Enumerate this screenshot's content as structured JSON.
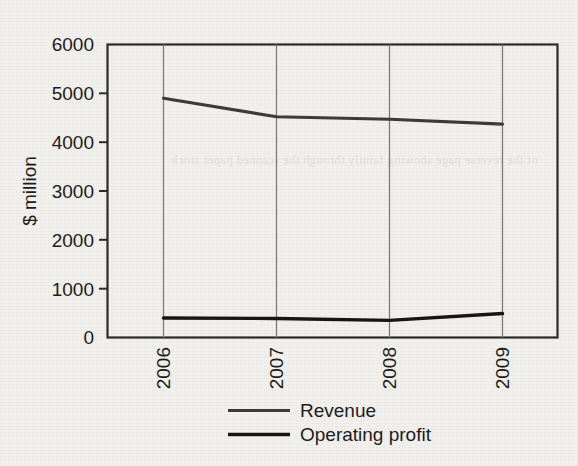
{
  "chart_data": {
    "type": "line",
    "title": "",
    "subtitle": "",
    "xlabel": "",
    "ylabel": "$ million",
    "categories": [
      "2006",
      "2007",
      "2008",
      "2009"
    ],
    "series": [
      {
        "name": "Revenue",
        "values": [
          4900,
          4520,
          4470,
          4370
        ]
      },
      {
        "name": "Operating profit",
        "values": [
          400,
          390,
          350,
          490
        ]
      }
    ],
    "ylim": [
      0,
      6000
    ],
    "yticks": [
      0,
      1000,
      2000,
      3000,
      4000,
      5000,
      6000
    ],
    "ytick_labels": [
      "0",
      "1000",
      "2000",
      "3000",
      "4000",
      "5000",
      "6000"
    ],
    "grid": "vertical-only",
    "legend_position": "bottom-center",
    "xtick_rotation": -90,
    "colors": {
      "revenue_line": "#3a3a3a",
      "operating_profit_line": "#141414",
      "axis": "#2a2a2a",
      "gridline": "#7b7b7b",
      "background": "#f1f0ed",
      "text": "#1b1b1b"
    }
  },
  "axis": {
    "y_title": "$ million",
    "y_labels": {
      "t6000": "6000",
      "t5000": "5000",
      "t4000": "4000",
      "t3000": "3000",
      "t2000": "2000",
      "t1000": "1000",
      "t0": "0"
    },
    "x_labels": {
      "c0": "2006",
      "c1": "2007",
      "c2": "2008",
      "c3": "2009"
    }
  },
  "legend": {
    "items": [
      {
        "label": "Revenue"
      },
      {
        "label": "Operating profit"
      }
    ]
  },
  "scan_artifact": {
    "ghost_text": "of the reverse page showing faintly through the scanned paper stock"
  }
}
